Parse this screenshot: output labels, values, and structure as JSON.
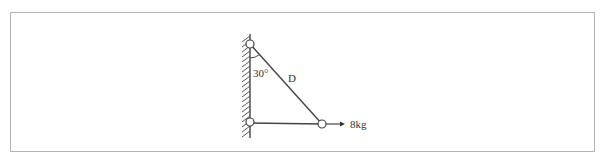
{
  "diagram": {
    "type": "statics-truss",
    "labels": {
      "angle": "30°",
      "member": "D",
      "load": "8kg"
    },
    "colors": {
      "line": "#444444",
      "frame": "#b4b4b4",
      "background": "#ffffff"
    },
    "nodes": [
      {
        "id": "top-wall-pin",
        "x": 250,
        "y": 44
      },
      {
        "id": "bottom-wall-pin",
        "x": 250,
        "y": 122
      },
      {
        "id": "load-joint",
        "x": 322,
        "y": 124
      }
    ],
    "members": [
      {
        "id": "D",
        "from": "top-wall-pin",
        "to": "load-joint"
      },
      {
        "id": "horizontal",
        "from": "bottom-wall-pin",
        "to": "load-joint"
      }
    ],
    "load": {
      "at": "load-joint",
      "direction": "right",
      "value": "8kg"
    }
  }
}
